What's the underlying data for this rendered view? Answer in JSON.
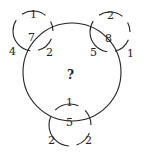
{
  "puzzle": {
    "center_label": "?",
    "circles": {
      "top_left": {
        "top": "1",
        "center": "7",
        "left": "4",
        "right": "2"
      },
      "top_right": {
        "top": "2",
        "center": "8",
        "left": "5",
        "right": "1"
      },
      "bottom": {
        "top": "1",
        "center": "5",
        "left": "2",
        "right": "2"
      }
    },
    "stroke_color": "#222222"
  }
}
